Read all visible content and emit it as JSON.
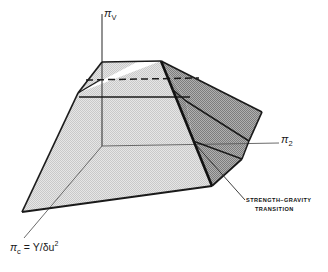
{
  "figure": {
    "name": "strength-gravity-transition-diagram",
    "type": "3d-schematic-block-diagram",
    "background_color": "#ffffff",
    "line_color": "#1a1a1a",
    "light_face_color": "#dcdcdc",
    "dark_face_color": "#969696",
    "mid_face_color": "#b5b5b5"
  },
  "axes": {
    "vertical": {
      "name": "pi-v-axis",
      "label_text": "π",
      "label_sub": "V",
      "description": "vertical axis rising from origin"
    },
    "right": {
      "name": "pi-2-axis",
      "label_text": "π",
      "label_sub": "2",
      "description": "axis extending to the right"
    },
    "depth": {
      "name": "pi-c-axis",
      "label_text": "π",
      "label_sub": "c",
      "equals": "=",
      "numerator": "Y",
      "solidus": "/",
      "denominator_symbol": "δ",
      "denominator_var": "u",
      "denominator_exp": "2",
      "full_text": "πc = Y / δu2",
      "description": "axis extending toward lower-left (into depth)"
    }
  },
  "annotations": [
    {
      "name": "strength-gravity-transition-annotation",
      "line1": "STRENGTH–GRAVITY",
      "line2": "TRANSITION",
      "has_leader_line": true
    }
  ],
  "surfaces": [
    {
      "name": "front-face",
      "shade": "light",
      "color": "#dcdcdc"
    },
    {
      "name": "top-face",
      "shade": "light",
      "color": "#dcdcdc"
    },
    {
      "name": "right-face-upper",
      "shade": "dark",
      "color": "#969696"
    },
    {
      "name": "right-face-lower",
      "shade": "dark",
      "color": "#969696"
    },
    {
      "name": "right-face-wedge",
      "shade": "dark",
      "color": "#8f8f8f"
    }
  ],
  "guide_lines": [
    {
      "name": "dashed-upper-contour",
      "style": "dashed"
    },
    {
      "name": "solid-upper-contour",
      "style": "solid"
    },
    {
      "name": "solid-mid-contour",
      "style": "solid"
    }
  ]
}
